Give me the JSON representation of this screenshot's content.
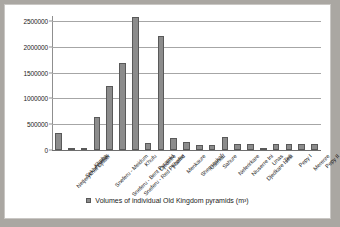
{
  "chart_data": {
    "type": "bar",
    "title": "",
    "xlabel": "",
    "ylabel": "",
    "ylim": [
      0,
      2600000
    ],
    "grid": true,
    "legend_position": "bottom",
    "legend_label": "Volumes of individual Old Kingdom pyramids (m³)",
    "ytick_labels": [
      "0",
      "500000",
      "1000000",
      "1500000",
      "2000000",
      "2500000"
    ],
    "ytick_values": [
      0,
      500000,
      1000000,
      1500000,
      2000000,
      2500000
    ],
    "categories": [
      "Netjerykhet Djoser",
      "Sekhemkhet",
      "Khaba",
      "Sneferu - Meidum",
      "Sneferu - Bent Pyramid",
      "Sneferu - Red Pyramid",
      "Khufu",
      "Djedefre",
      "Khafre",
      "Menkaure",
      "Shepseskaf",
      "Userkaf",
      "Sahure",
      "Neferirkare",
      "Niuserre Ini",
      "Djedkare Isesi",
      "Unas",
      "Teti",
      "Pepy I",
      "Merenre",
      "Pepy II"
    ],
    "values": [
      330400,
      33000,
      47000,
      638733,
      1237040,
      1694000,
      2583283,
      131043,
      2211096,
      235183,
      148000,
      87906,
      96542,
      257250,
      112632,
      107835,
      47390,
      107835,
      107835,
      107835,
      107835
    ],
    "series_name": "Volumes of individual Old Kingdom pyramids (m³)",
    "bar_color": "#8c8c8c",
    "bar_border_color": "#595959",
    "grid_color": "#a6a6a6",
    "plot_background": "#ffffff",
    "page_background": "#aaa7a2"
  }
}
